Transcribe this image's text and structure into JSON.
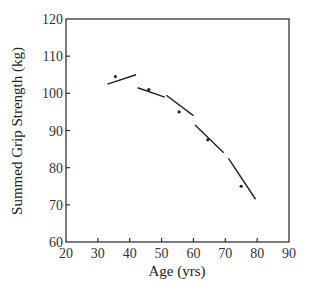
{
  "chart_data": {
    "type": "scatter",
    "title": "",
    "xlabel": "Age (yrs)",
    "ylabel": "Summed Grip Strength (kg)",
    "xlim": [
      20,
      90
    ],
    "ylim": [
      60,
      120
    ],
    "xticks": [
      20,
      30,
      40,
      50,
      60,
      70,
      80,
      90
    ],
    "yticks": [
      60,
      70,
      80,
      90,
      100,
      110,
      120
    ],
    "grid": false,
    "legend": null,
    "points": [
      {
        "x": 35.5,
        "y": 104.5
      },
      {
        "x": 46.0,
        "y": 101.0
      },
      {
        "x": 55.5,
        "y": 95.0
      },
      {
        "x": 64.5,
        "y": 87.5
      },
      {
        "x": 75.0,
        "y": 75.0
      }
    ],
    "segments": [
      {
        "x1": 33.0,
        "y1": 102.5,
        "x2": 42.0,
        "y2": 105.0
      },
      {
        "x1": 42.5,
        "y1": 101.5,
        "x2": 51.0,
        "y2": 99.0
      },
      {
        "x1": 51.5,
        "y1": 99.5,
        "x2": 60.0,
        "y2": 94.0
      },
      {
        "x1": 60.5,
        "y1": 91.5,
        "x2": 69.5,
        "y2": 84.0
      },
      {
        "x1": 71.0,
        "y1": 82.5,
        "x2": 79.5,
        "y2": 71.5
      }
    ]
  }
}
